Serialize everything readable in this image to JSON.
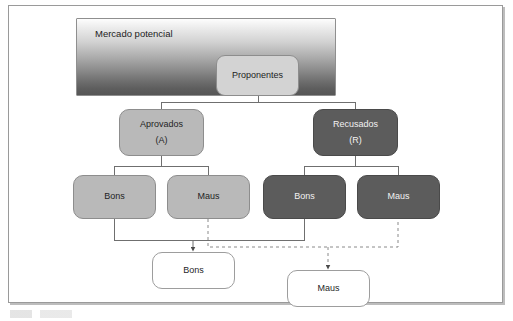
{
  "figure": {
    "type": "flow-diagram",
    "language": "pt-BR",
    "title_text": "Mercado potencial"
  },
  "nodes": {
    "banner": {
      "label": "Mercado potencial"
    },
    "proponentes": {
      "label": "Proponentes"
    },
    "aprovados": {
      "label": "Aprovados",
      "sublabel": "(A)"
    },
    "recusados": {
      "label": "Recusados",
      "sublabel": "(R)"
    },
    "aprovados_bons": {
      "label": "Bons"
    },
    "aprovados_maus": {
      "label": "Maus"
    },
    "recusados_bons": {
      "label": "Bons"
    },
    "recusados_maus": {
      "label": "Maus"
    },
    "output_bons": {
      "label": "Bons"
    },
    "output_maus": {
      "label": "Maus"
    }
  },
  "colors": {
    "banner_gradient_top": "#fdfdfd",
    "banner_gradient_bottom": "#565656",
    "light_node_fill": "#b9b9b9",
    "dark_node_fill": "#5c5c5c",
    "proponentes_fill": "#d3d3d3",
    "output_fill": "#ffffff",
    "connector_solid": "#6f6f6f",
    "connector_dashed": "#8a8a8a",
    "frame_border": "#9a9a9a"
  },
  "connectors": [
    {
      "name": "proponentes-to-aprovados",
      "style": "solid"
    },
    {
      "name": "proponentes-to-recusados",
      "style": "solid"
    },
    {
      "name": "aprovados-to-bons",
      "style": "solid"
    },
    {
      "name": "aprovados-to-maus",
      "style": "solid"
    },
    {
      "name": "recusados-to-bons",
      "style": "solid"
    },
    {
      "name": "recusados-to-maus",
      "style": "solid"
    },
    {
      "name": "aprovados-bons-to-output-bons",
      "style": "solid",
      "arrow": true
    },
    {
      "name": "recusados-bons-to-output-bons",
      "style": "solid",
      "arrow": true
    },
    {
      "name": "aprovados-maus-to-output-maus",
      "style": "dashed",
      "arrow": true
    },
    {
      "name": "recusados-maus-to-output-maus",
      "style": "dashed",
      "arrow": true
    }
  ]
}
